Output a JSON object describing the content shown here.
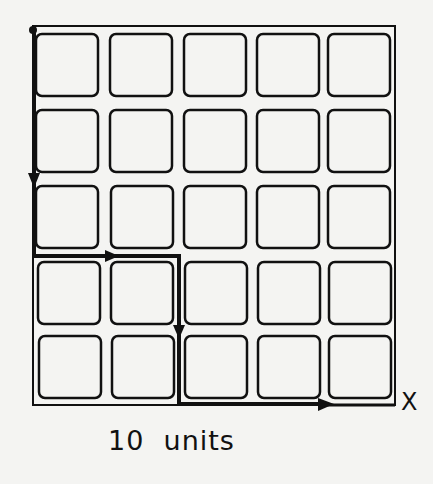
{
  "diagram": {
    "grid": {
      "rows": 5,
      "cols": 5,
      "cell_shape": "rounded-square"
    },
    "path": {
      "description": "Path from top-left corner down 3 cells, right 2 cells, down 2 cells, right 3 cells to X",
      "segments": [
        "down",
        "right",
        "down",
        "right"
      ]
    },
    "end_marker": "X",
    "caption": "10  units",
    "colors": {
      "ink": "#111111",
      "paper": "#f4f4f2"
    }
  }
}
